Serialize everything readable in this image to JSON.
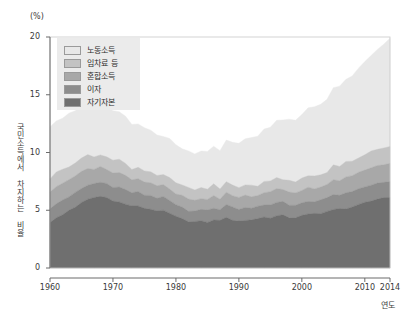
{
  "chart": {
    "unit_label": "(%)",
    "ylabel": "국민소득에서 차지하는 비율",
    "xlabel": "연도"
  },
  "chart_data": {
    "type": "area",
    "stacked": true,
    "title": "",
    "subtitle": "",
    "xlabel": "연도",
    "ylabel": "국민소득에서 차지하는 비율",
    "unit": "%",
    "xlim": [
      1960,
      2014
    ],
    "ylim": [
      0,
      20
    ],
    "yticks": [
      0,
      5,
      10,
      15,
      20
    ],
    "xticks": [
      1960,
      1970,
      1980,
      1990,
      2000,
      2010,
      2014
    ],
    "grid": false,
    "legend_position": "top-left",
    "legend_order_top_to_bottom": [
      "노동소득",
      "임차료 등",
      "혼합소득",
      "이자",
      "자기자본"
    ],
    "colors": {
      "노동소득": "#e8e8e8",
      "임차료 등": "#c3c3c3",
      "혼합소득": "#a8a8a8",
      "이자": "#8d8d8d",
      "자기자본": "#6f6f6f"
    },
    "x": [
      1960,
      1961,
      1962,
      1963,
      1964,
      1965,
      1966,
      1967,
      1968,
      1969,
      1970,
      1971,
      1972,
      1973,
      1974,
      1975,
      1976,
      1977,
      1978,
      1979,
      1980,
      1981,
      1982,
      1983,
      1984,
      1985,
      1986,
      1987,
      1988,
      1989,
      1990,
      1991,
      1992,
      1993,
      1994,
      1995,
      1996,
      1997,
      1998,
      1999,
      2000,
      2001,
      2002,
      2003,
      2004,
      2005,
      2006,
      2007,
      2008,
      2009,
      2010,
      2011,
      2012,
      2013,
      2014
    ],
    "series": [
      {
        "name": "자기자본",
        "values": [
          4.0,
          4.3,
          4.6,
          5.0,
          5.3,
          5.6,
          5.9,
          6.1,
          6.2,
          6.1,
          5.9,
          5.7,
          5.5,
          5.4,
          5.3,
          5.2,
          5.1,
          5.0,
          4.9,
          4.7,
          4.4,
          4.2,
          4.1,
          4.0,
          4.0,
          4.0,
          4.1,
          4.2,
          4.3,
          4.2,
          4.1,
          4.1,
          4.2,
          4.3,
          4.4,
          4.4,
          4.5,
          4.5,
          4.4,
          4.4,
          4.5,
          4.6,
          4.7,
          4.8,
          4.9,
          5.0,
          5.1,
          5.2,
          5.3,
          5.4,
          5.6,
          5.8,
          6.0,
          6.1,
          6.2
        ]
      },
      {
        "name": "이자",
        "values": [
          1.3,
          1.3,
          1.3,
          1.2,
          1.2,
          1.2,
          1.2,
          1.2,
          1.2,
          1.2,
          1.2,
          1.2,
          1.2,
          1.2,
          1.2,
          1.1,
          1.1,
          1.1,
          1.1,
          1.1,
          1.0,
          1.0,
          1.0,
          1.0,
          1.0,
          1.0,
          1.0,
          1.0,
          1.1,
          1.1,
          1.1,
          1.1,
          1.1,
          1.1,
          1.1,
          1.1,
          1.1,
          1.1,
          1.1,
          1.1,
          1.1,
          1.1,
          1.1,
          1.2,
          1.2,
          1.2,
          1.2,
          1.3,
          1.3,
          1.3,
          1.3,
          1.4,
          1.4,
          1.4,
          1.4
        ]
      },
      {
        "name": "혼합소득",
        "values": [
          1.5,
          1.5,
          1.5,
          1.4,
          1.4,
          1.4,
          1.4,
          1.3,
          1.3,
          1.3,
          1.3,
          1.2,
          1.2,
          1.2,
          1.2,
          1.2,
          1.1,
          1.1,
          1.1,
          1.1,
          1.0,
          1.0,
          1.0,
          1.0,
          1.0,
          1.0,
          1.0,
          1.0,
          1.0,
          1.0,
          1.0,
          1.0,
          1.0,
          1.0,
          1.1,
          1.1,
          1.1,
          1.1,
          1.1,
          1.1,
          1.1,
          1.2,
          1.2,
          1.2,
          1.2,
          1.3,
          1.3,
          1.4,
          1.4,
          1.4,
          1.5,
          1.5,
          1.5,
          1.5,
          1.5
        ]
      },
      {
        "name": "임차료 등",
        "values": [
          1.2,
          1.2,
          1.2,
          1.2,
          1.2,
          1.2,
          1.1,
          1.1,
          1.1,
          1.1,
          1.1,
          1.1,
          1.0,
          1.0,
          1.0,
          1.0,
          1.0,
          0.9,
          0.9,
          0.9,
          0.9,
          0.9,
          0.9,
          0.9,
          0.9,
          0.9,
          0.9,
          0.9,
          0.9,
          0.9,
          0.9,
          0.9,
          0.9,
          0.9,
          0.9,
          0.9,
          0.9,
          0.9,
          1.0,
          1.0,
          1.0,
          1.0,
          1.1,
          1.1,
          1.1,
          1.2,
          1.2,
          1.3,
          1.3,
          1.3,
          1.4,
          1.4,
          1.5,
          1.5,
          1.5
        ]
      },
      {
        "name": "노동소득",
        "values": [
          4.6,
          4.5,
          4.5,
          4.6,
          4.6,
          4.7,
          4.7,
          4.6,
          4.5,
          4.3,
          4.2,
          4.1,
          4.0,
          3.9,
          3.8,
          3.7,
          3.6,
          3.5,
          3.4,
          3.3,
          3.2,
          3.1,
          3.1,
          3.1,
          3.1,
          3.2,
          3.3,
          3.4,
          3.5,
          3.6,
          3.8,
          3.9,
          4.1,
          4.3,
          4.5,
          4.7,
          4.9,
          5.1,
          5.2,
          5.4,
          5.6,
          5.8,
          6.0,
          6.2,
          6.4,
          6.6,
          6.9,
          7.2,
          7.4,
          7.7,
          8.0,
          8.3,
          8.6,
          9.0,
          9.4
        ]
      }
    ],
    "totals_note": "총합은 1960년 약 12.6%에서 1980년대 중반 약 9.5%로 하락한 뒤 2014년 약 20%까지 상승"
  }
}
